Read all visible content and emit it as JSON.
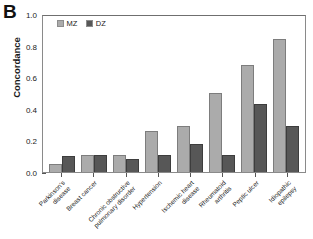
{
  "panel": {
    "label": "B"
  },
  "chart_data": {
    "type": "bar",
    "title": "",
    "xlabel": "",
    "ylabel": "Concordance",
    "ylim": [
      0,
      1.0
    ],
    "ytick_labels": [
      "0.0",
      "0.2",
      "0.4",
      "0.6",
      "0.8",
      "1.0"
    ],
    "ytick_values": [
      0,
      0.2,
      0.4,
      0.6,
      0.8,
      1.0
    ],
    "grid": false,
    "legend_position": "top-left",
    "categories": [
      "Parkinson's disease",
      "Breast cancer",
      "Chronic obstructive pulmonary disorder",
      "Hypertension",
      "Ischemic heart disease",
      "Rheumatoid arthritis",
      "Peptic ulcer",
      "Idiopathic epilepsy"
    ],
    "category_lines": [
      [
        "Parkinson's",
        "disease"
      ],
      [
        "Breast cancer"
      ],
      [
        "Chronic obstructive",
        "pulmonary disorder"
      ],
      [
        "Hypertension"
      ],
      [
        "Ischemic heart",
        "disease"
      ],
      [
        "Rheumatoid",
        "arthritis"
      ],
      [
        "Peptic ulcer"
      ],
      [
        "Idiopathic",
        "epilepsy"
      ]
    ],
    "series": [
      {
        "name": "MZ",
        "color": "#ababab",
        "values": [
          0.05,
          0.11,
          0.11,
          0.26,
          0.29,
          0.5,
          0.68,
          0.84
        ]
      },
      {
        "name": "DZ",
        "color": "#575757",
        "values": [
          0.1,
          0.11,
          0.08,
          0.11,
          0.18,
          0.11,
          0.43,
          0.29
        ]
      }
    ]
  }
}
